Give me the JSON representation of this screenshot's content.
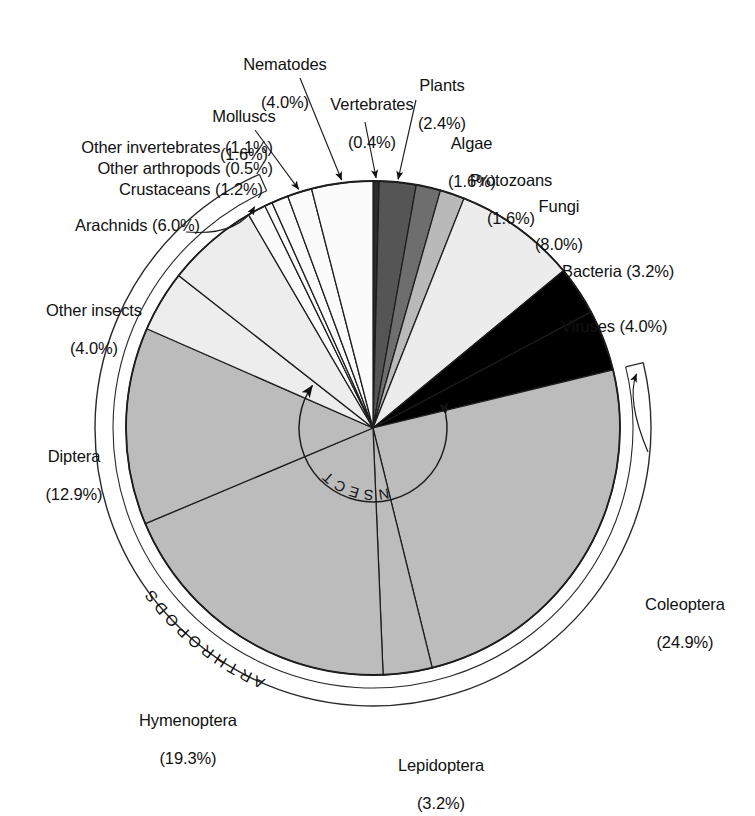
{
  "chart_data": {
    "type": "pie",
    "title": "",
    "subtitle": "",
    "units": "percent of described species",
    "legend_position": "callout-labels",
    "grid": false,
    "total_percent": 100.0,
    "start_angle_deg": 0,
    "direction": "clockwise",
    "categories": [
      "Vertebrates",
      "Plants",
      "Algae",
      "Protozoans",
      "Fungi",
      "Bacteria",
      "Viruses",
      "Coleoptera",
      "Lepidoptera",
      "Hymenoptera",
      "Diptera",
      "Other insects",
      "Arachnids",
      "Crustaceans",
      "Other arthropods",
      "Other invertebrates",
      "Molluscs",
      "Nematodes"
    ],
    "values": [
      0.4,
      2.4,
      1.6,
      1.6,
      8.0,
      3.2,
      4.0,
      24.9,
      3.2,
      19.3,
      12.9,
      4.0,
      6.0,
      1.2,
      0.5,
      1.1,
      1.6,
      4.0
    ],
    "colors": [
      "#2b2b2b",
      "#555555",
      "#6e6e6e",
      "#b9b9b9",
      "#ececec",
      "#000000",
      "#000000",
      "#bcbcbc",
      "#bcbcbc",
      "#bcbcbc",
      "#bcbcbc",
      "#ededed",
      "#ededed",
      "#fbfbfb",
      "#fbfbfb",
      "#fbfbfb",
      "#fbfbfb",
      "#fbfbfb"
    ],
    "slices": [
      {
        "label": "Vertebrates",
        "value": 0.4,
        "text": "Vertebrates",
        "pct": "(0.4%)",
        "color": "#2b2b2b"
      },
      {
        "label": "Plants",
        "value": 2.4,
        "text": "Plants",
        "pct": "(2.4%)",
        "color": "#555555"
      },
      {
        "label": "Algae",
        "value": 1.6,
        "text": "Algae",
        "pct": "(1.6%)",
        "color": "#6e6e6e"
      },
      {
        "label": "Protozoans",
        "value": 1.6,
        "text": "Protozoans",
        "pct": "(1.6%)",
        "color": "#b9b9b9"
      },
      {
        "label": "Fungi",
        "value": 8.0,
        "text": "Fungi",
        "pct": "(8.0%)",
        "color": "#ececec"
      },
      {
        "label": "Bacteria",
        "value": 3.2,
        "text": "Bacteria",
        "pct": "(3.2%)",
        "color": "#000000"
      },
      {
        "label": "Viruses",
        "value": 4.0,
        "text": "Viruses",
        "pct": "(4.0%)",
        "color": "#000000"
      },
      {
        "label": "Coleoptera",
        "value": 24.9,
        "text": "Coleoptera",
        "pct": "(24.9%)",
        "color": "#bcbcbc"
      },
      {
        "label": "Lepidoptera",
        "value": 3.2,
        "text": "Lepidoptera",
        "pct": "(3.2%)",
        "color": "#bcbcbc"
      },
      {
        "label": "Hymenoptera",
        "value": 19.3,
        "text": "Hymenoptera",
        "pct": "(19.3%)",
        "color": "#bcbcbc"
      },
      {
        "label": "Diptera",
        "value": 12.9,
        "text": "Diptera",
        "pct": "(12.9%)",
        "color": "#bcbcbc"
      },
      {
        "label": "Other insects",
        "value": 4.0,
        "text": "Other insects",
        "pct": "(4.0%)",
        "color": "#ededed"
      },
      {
        "label": "Arachnids",
        "value": 6.0,
        "text": "Arachnids",
        "pct": "(6.0%)",
        "color": "#ededed"
      },
      {
        "label": "Crustaceans",
        "value": 1.2,
        "text": "Crustaceans",
        "pct": "(1.2%)",
        "color": "#fbfbfb"
      },
      {
        "label": "Other arthropods",
        "value": 0.5,
        "text": "Other arthropods",
        "pct": "(0.5%)",
        "color": "#fbfbfb"
      },
      {
        "label": "Other invertebrates",
        "value": 1.1,
        "text": "Other invertebrates",
        "pct": "(1.1%)",
        "color": "#fbfbfb"
      },
      {
        "label": "Molluscs",
        "value": 1.6,
        "text": "Molluscs",
        "pct": "(1.6%)",
        "color": "#fbfbfb"
      },
      {
        "label": "Nematodes",
        "value": 4.0,
        "text": "Nematodes",
        "pct": "(4.0%)",
        "color": "#fbfbfb"
      }
    ],
    "group_annotations": [
      {
        "name": "INSECTS",
        "text": "I N S E C T S",
        "spans": [
          "Coleoptera",
          "Lepidoptera",
          "Hymenoptera",
          "Diptera",
          "Other insects"
        ],
        "style": "inner-arc-with-arrowheads"
      },
      {
        "name": "ARTHROPODS",
        "text": "A R T H R O P O D S",
        "spans": [
          "Coleoptera",
          "Lepidoptera",
          "Hymenoptera",
          "Diptera",
          "Other insects",
          "Arachnids",
          "Crustaceans",
          "Other arthropods"
        ],
        "style": "outer-arc"
      }
    ]
  },
  "labels": {
    "nematodes": {
      "name": "Nematodes",
      "pct": "(4.0%)"
    },
    "molluscs": {
      "name": "Molluscs",
      "pct": "(1.6%)"
    },
    "vertebrates": {
      "name": "Vertebrates",
      "pct": "(0.4%)"
    },
    "plants": {
      "name": "Plants",
      "pct": "(2.4%)"
    },
    "algae": {
      "name": "Algae",
      "pct": "(1.6%)"
    },
    "protozoans": {
      "name": "Protozoans",
      "pct": "(1.6%)"
    },
    "fungi": {
      "name": "Fungi",
      "pct": "(8.0%)"
    },
    "bacteria": {
      "inline": "Bacteria (3.2%)"
    },
    "viruses": {
      "inline": "Viruses (4.0%)"
    },
    "other_invertebrates": {
      "inline": "Other invertebrates (1.1%)"
    },
    "other_arthropods": {
      "inline": "Other arthropods (0.5%)"
    },
    "crustaceans": {
      "inline": "Crustaceans (1.2%)"
    },
    "arachnids": {
      "inline": "Arachnids (6.0%)"
    },
    "other_insects": {
      "name": "Other insects",
      "pct": "(4.0%)"
    },
    "diptera": {
      "name": "Diptera",
      "pct": "(12.9%)"
    },
    "hymenoptera": {
      "name": "Hymenoptera",
      "pct": "(19.3%)"
    },
    "lepidoptera": {
      "name": "Lepidoptera",
      "pct": "(3.2%)"
    },
    "coleoptera": {
      "name": "Coleoptera",
      "pct": "(24.9%)"
    }
  },
  "arc_labels": {
    "insects": "I N S E C T S",
    "arthropods": "A R T H R O P O D S"
  }
}
